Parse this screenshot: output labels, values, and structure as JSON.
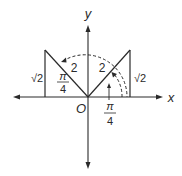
{
  "diagram": {
    "type": "coordinate-geometry",
    "axes": {
      "x_label": "x",
      "y_label": "y",
      "origin_label": "O"
    },
    "left_triangle": {
      "hypotenuse_label": "2",
      "vertical_label": "√2",
      "angle_label_num": "π",
      "angle_label_den": "4"
    },
    "right_triangle": {
      "hypotenuse_label": "2",
      "vertical_label": "√2",
      "angle_label_num": "π",
      "angle_label_den": "4"
    },
    "colors": {
      "line": "#2a2a2a",
      "background": "#ffffff"
    }
  }
}
